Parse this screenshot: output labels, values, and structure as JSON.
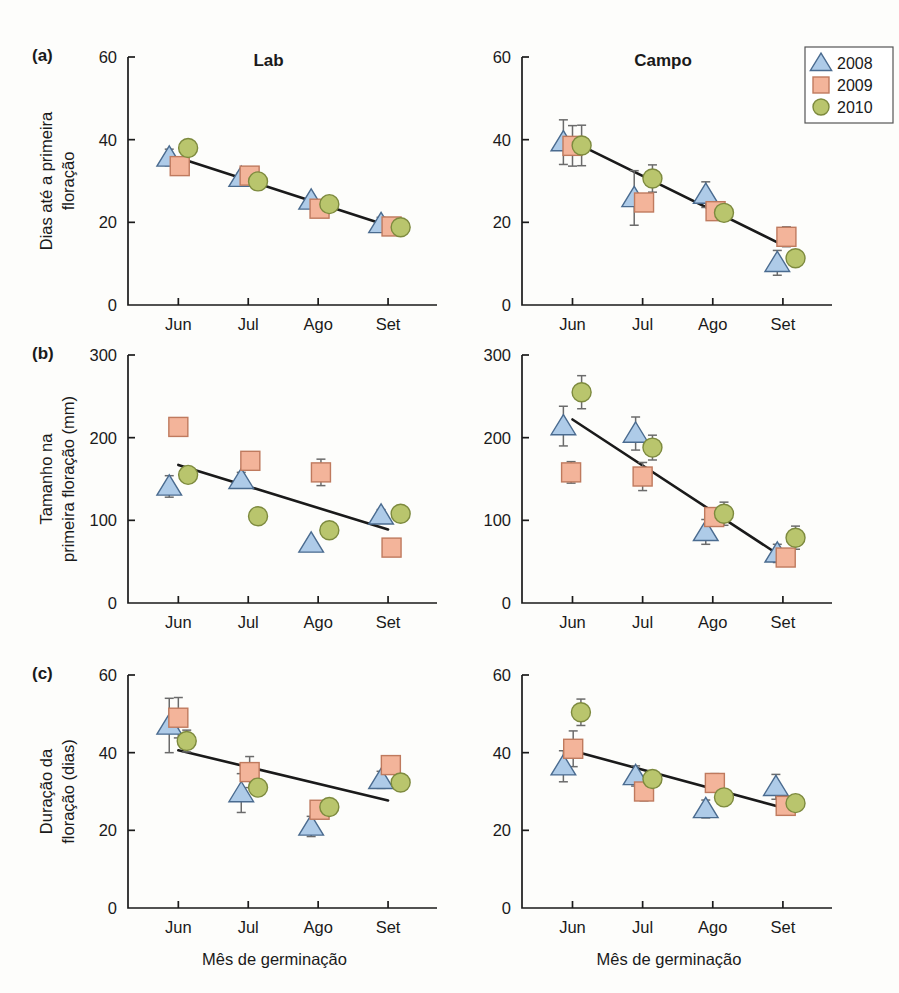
{
  "figure": {
    "columns": [
      "Lab",
      "Campo"
    ],
    "x_axis_title": "Mês de germinação",
    "x_categories": [
      "Jun",
      "Jul",
      "Ago",
      "Set"
    ],
    "panels": [
      {
        "letter": "(a)",
        "ylabel_lines": [
          "Dias até a primeira",
          "floração"
        ],
        "ylim": [
          0,
          60
        ],
        "yticks": [
          0,
          20,
          40,
          60
        ]
      },
      {
        "letter": "(b)",
        "ylabel_lines": [
          "Tamanho na",
          "primeira floração (mm)"
        ],
        "ylim": [
          0,
          300
        ],
        "yticks": [
          0,
          100,
          200,
          300
        ]
      },
      {
        "letter": "(c)",
        "ylabel_lines": [
          "Duração da",
          "floração (dias)"
        ],
        "ylim": [
          0,
          60
        ],
        "yticks": [
          0,
          20,
          40,
          60
        ]
      }
    ]
  },
  "legend": {
    "position": "top-right",
    "entries": [
      {
        "label": "2008",
        "marker": "triangle",
        "color": "#aecbe8"
      },
      {
        "label": "2009",
        "marker": "square",
        "color": "#f3b49a"
      },
      {
        "label": "2010",
        "marker": "circle",
        "color": "#b9c56d"
      }
    ]
  },
  "colors": {
    "series_2008": "#aecbe8",
    "series_2009": "#f3b49a",
    "series_2010": "#b9c56d",
    "edge_2008": "#4a6b8f",
    "edge_2009": "#bf7a5e",
    "edge_2010": "#7d8a3e",
    "axis": "#1a1a1a",
    "errorbar": "#6b6b6b",
    "fitline": "#1a1a1a",
    "background": "#fdfdfb"
  },
  "chart_data": [
    {
      "id": "a-lab",
      "type": "scatter",
      "title": "Lab",
      "panel": "(a)",
      "xlabel": "Mês de germinação",
      "ylabel": "Dias até a primeira floração",
      "categories": [
        "Jun",
        "Jul",
        "Ago",
        "Set"
      ],
      "ylim": [
        0,
        60
      ],
      "yticks": [
        0,
        20,
        40,
        60
      ],
      "grid": false,
      "series": [
        {
          "name": "2008",
          "values": [
            35.7,
            30.8,
            25.3,
            19.6
          ],
          "errors": [
            2.0,
            1.2,
            1.0,
            1.6
          ],
          "dx": [
            -0.13,
            -0.1,
            -0.1,
            -0.1
          ]
        },
        {
          "name": "2009",
          "values": [
            33.6,
            31.3,
            23.3,
            19.0
          ],
          "errors": [
            1.6,
            1.3,
            1.0,
            1.3
          ],
          "dx": [
            0.02,
            0.02,
            0.02,
            0.05
          ]
        },
        {
          "name": "2010",
          "values": [
            38.0,
            29.9,
            24.4,
            18.8
          ],
          "errors": [
            1.9,
            0.8,
            1.0,
            0.7
          ],
          "dx": [
            0.14,
            0.14,
            0.16,
            0.18
          ]
        }
      ],
      "fit_line": {
        "x_start": "Jun",
        "y_start": 35.6,
        "x_end": "Set",
        "y_end": 19.2
      }
    },
    {
      "id": "a-campo",
      "type": "scatter",
      "title": "Campo",
      "panel": "(a)",
      "xlabel": "Mês de germinação",
      "ylabel": "Dias até a primeira floração",
      "categories": [
        "Jun",
        "Jul",
        "Ago",
        "Set"
      ],
      "ylim": [
        0,
        60
      ],
      "yticks": [
        0,
        20,
        40,
        60
      ],
      "grid": false,
      "series": [
        {
          "name": "2008",
          "values": [
            39.4,
            25.9,
            26.7,
            10.2
          ],
          "errors": [
            5.4,
            6.6,
            3.1,
            3.0
          ],
          "dx": [
            -0.13,
            -0.12,
            -0.1,
            -0.08
          ]
        },
        {
          "name": "2009",
          "values": [
            38.5,
            24.8,
            22.7,
            16.5
          ],
          "errors": [
            4.9,
            2.0,
            1.7,
            2.4
          ],
          "dx": [
            0.0,
            0.02,
            0.04,
            0.05
          ]
        },
        {
          "name": "2010",
          "values": [
            38.6,
            30.6,
            22.3,
            11.3
          ],
          "errors": [
            4.9,
            3.3,
            1.8,
            0.8
          ],
          "dx": [
            0.13,
            0.14,
            0.16,
            0.18
          ]
        }
      ],
      "fit_line": {
        "x_start": "Jun",
        "y_start": 39.6,
        "x_end": "Set",
        "y_end": 14.5
      }
    },
    {
      "id": "b-lab",
      "type": "scatter",
      "title": "Lab",
      "panel": "(b)",
      "xlabel": "Mês de germinação",
      "ylabel": "Tamanho na primeira floração (mm)",
      "categories": [
        "Jun",
        "Jul",
        "Ago",
        "Set"
      ],
      "ylim": [
        0,
        300
      ],
      "yticks": [
        0,
        100,
        200,
        300
      ],
      "grid": false,
      "series": [
        {
          "name": "2008",
          "values": [
            141,
            149,
            72,
            106
          ],
          "errors": [
            13,
            9,
            5,
            7
          ],
          "dx": [
            -0.13,
            -0.1,
            -0.1,
            -0.1
          ]
        },
        {
          "name": "2009",
          "values": [
            213,
            172,
            158,
            67
          ],
          "errors": [
            7,
            11,
            16,
            6
          ],
          "dx": [
            0.0,
            0.03,
            0.04,
            0.05
          ]
        },
        {
          "name": "2010",
          "values": [
            155,
            105,
            88,
            108
          ],
          "errors": [
            9,
            6,
            8,
            8
          ],
          "dx": [
            0.14,
            0.14,
            0.16,
            0.18
          ]
        }
      ],
      "fit_line": {
        "x_start": "Jun",
        "y_start": 167,
        "x_end": "Set",
        "y_end": 89
      }
    },
    {
      "id": "b-campo",
      "type": "scatter",
      "title": "Campo",
      "panel": "(b)",
      "xlabel": "Mês de germinação",
      "ylabel": "Tamanho na primeira floração (mm)",
      "categories": [
        "Jun",
        "Jul",
        "Ago",
        "Set"
      ],
      "ylim": [
        0,
        300
      ],
      "yticks": [
        0,
        100,
        200,
        300
      ],
      "grid": false,
      "series": [
        {
          "name": "2008",
          "values": [
            214,
            205,
            86,
            60
          ],
          "errors": [
            24,
            20,
            15,
            11
          ],
          "dx": [
            -0.13,
            -0.1,
            -0.1,
            -0.08
          ]
        },
        {
          "name": "2009",
          "values": [
            158,
            153,
            104,
            55
          ],
          "errors": [
            13,
            17,
            11,
            10
          ],
          "dx": [
            -0.02,
            0.0,
            0.02,
            0.04
          ]
        },
        {
          "name": "2010",
          "values": [
            255,
            188,
            108,
            79
          ],
          "errors": [
            20,
            15,
            14,
            14
          ],
          "dx": [
            0.13,
            0.14,
            0.16,
            0.18
          ]
        }
      ],
      "fit_line": {
        "x_start": "Jun",
        "y_start": 222,
        "x_end": "Set",
        "y_end": 55
      }
    },
    {
      "id": "c-lab",
      "type": "scatter",
      "title": "Lab",
      "panel": "(c)",
      "xlabel": "Mês de germinação",
      "ylabel": "Duração da floração (dias)",
      "categories": [
        "Jun",
        "Jul",
        "Ago",
        "Set"
      ],
      "ylim": [
        0,
        60
      ],
      "yticks": [
        0,
        20,
        40,
        60
      ],
      "grid": false,
      "series": [
        {
          "name": "2008",
          "values": [
            47.0,
            29.6,
            21.0,
            33.0
          ],
          "errors": [
            7.0,
            5.0,
            2.6,
            2.2
          ],
          "dx": [
            -0.13,
            -0.1,
            -0.1,
            -0.1
          ]
        },
        {
          "name": "2009",
          "values": [
            49.0,
            35.0,
            25.3,
            36.8
          ],
          "errors": [
            5.2,
            4.0,
            2.0,
            1.6
          ],
          "dx": [
            0.0,
            0.02,
            0.02,
            0.04
          ]
        },
        {
          "name": "2010",
          "values": [
            43.0,
            31.0,
            26.0,
            32.3
          ],
          "errors": [
            2.8,
            2.0,
            2.1,
            1.3
          ],
          "dx": [
            0.12,
            0.14,
            0.16,
            0.18
          ]
        }
      ],
      "fit_line": {
        "x_start": "Jun",
        "y_start": 40.6,
        "x_end": "Set",
        "y_end": 27.7
      }
    },
    {
      "id": "c-campo",
      "type": "scatter",
      "title": "Campo",
      "panel": "(c)",
      "xlabel": "Mês de germinação",
      "ylabel": "Duração da floração (dias)",
      "categories": [
        "Jun",
        "Jul",
        "Ago",
        "Set"
      ],
      "ylim": [
        0,
        60
      ],
      "yticks": [
        0,
        20,
        40,
        60
      ],
      "grid": false,
      "series": [
        {
          "name": "2008",
          "values": [
            36.5,
            34.0,
            25.5,
            31.2
          ],
          "errors": [
            4.0,
            2.6,
            2.3,
            3.2
          ],
          "dx": [
            -0.13,
            -0.1,
            -0.1,
            -0.1
          ]
        },
        {
          "name": "2009",
          "values": [
            41.0,
            30.0,
            32.2,
            26.3
          ],
          "errors": [
            4.6,
            2.4,
            2.4,
            2.0
          ],
          "dx": [
            0.01,
            0.02,
            0.03,
            0.04
          ]
        },
        {
          "name": "2010",
          "values": [
            50.4,
            33.2,
            28.5,
            27.0
          ],
          "errors": [
            3.4,
            1.5,
            2.0,
            1.8
          ],
          "dx": [
            0.12,
            0.14,
            0.16,
            0.18
          ]
        }
      ],
      "fit_line": {
        "x_start": "Jun",
        "y_start": 40.5,
        "x_end": "Set",
        "y_end": 25.8
      }
    }
  ]
}
